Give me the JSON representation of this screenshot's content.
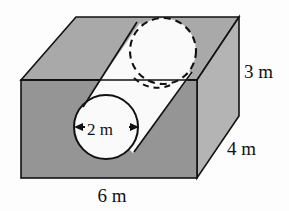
{
  "figure": {
    "colors": {
      "top_face": "#a9a9a9",
      "front_face": "#959595",
      "right_face": "#b4b4b4",
      "hole_fill": "#fafafa",
      "outline": "#111111",
      "background": "#fdfdfd"
    },
    "labels": {
      "height": "3 m",
      "depth": "4 m",
      "width": "6 m",
      "diameter": "2 m"
    },
    "dimensions": {
      "height_value": 3,
      "depth_value": 4,
      "width_value": 6,
      "hole_diameter_value": 2,
      "unit": "m"
    },
    "geometry": {
      "box": {
        "front_top_left": [
          21,
          80
        ],
        "front_top_right": [
          197,
          80
        ],
        "front_bottom_left": [
          21,
          178
        ],
        "front_bottom_right": [
          197,
          178
        ],
        "back_top_left": [
          76,
          17
        ],
        "back_top_right": [
          239,
          17
        ],
        "back_bottom_right": [
          239,
          116
        ]
      },
      "front_circle": {
        "cx": 106,
        "cy": 127,
        "r": 32
      },
      "top_ellipse": {
        "cx": 163,
        "cy": 51,
        "rx": 33,
        "ry": 33,
        "dashed": true
      }
    }
  }
}
